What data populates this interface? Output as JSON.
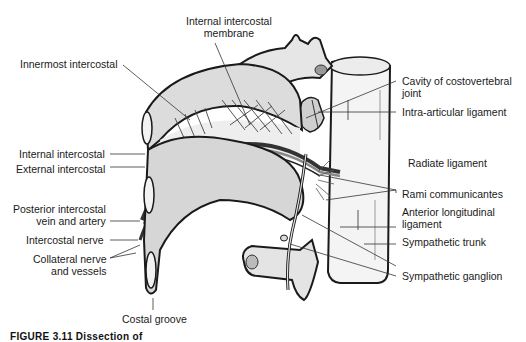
{
  "figure": {
    "caption_visible": "FIGURE 3.11   Dissection of"
  },
  "labels": {
    "internal_intercostal_membrane": "Internal intercostal\nmembrane",
    "innermost_intercostal": "Innermost intercostal",
    "internal_intercostal": "Internal intercostal",
    "external_intercostal": "External intercostal",
    "posterior_intercostal_vein_artery": "Posterior intercostal\nvein and artery",
    "intercostal_nerve": "Intercostal nerve",
    "collateral_nerve_vessels": "Collateral nerve\nand vessels",
    "costal_groove": "Costal groove",
    "cavity_costovertebral_joint": "Cavity of costovertebral\njoint",
    "intra_articular_ligament": "Intra-articular ligament",
    "radiate_ligament": "Radiate ligament",
    "rami_communicantes": "Rami communicantes",
    "anterior_longitudinal_ligament": "Anterior longitudinal\nligament",
    "sympathetic_trunk": "Sympathetic trunk",
    "sympathetic_ganglion": "Sympathetic ganglion"
  },
  "colors": {
    "outline": "#1a1a1a",
    "bone_fill": "#e9e9e9",
    "rib_fill": "#d8d8d8",
    "vessel_dark": "#3a3a3a",
    "vessel_mid": "#8a8a8a",
    "leader": "#333333"
  }
}
